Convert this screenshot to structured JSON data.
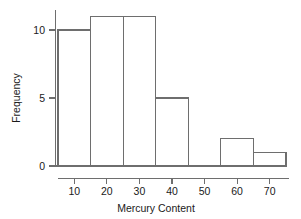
{
  "chart_data": {
    "type": "bar",
    "title": "",
    "subtitle": "",
    "xlabel": "Mercury Content",
    "ylabel": "Frequency",
    "grid": false,
    "legend": false,
    "legend_position": "none",
    "xlim": [
      0,
      78
    ],
    "ylim": [
      0,
      11.5
    ],
    "x_ticks": [
      10,
      20,
      30,
      40,
      50,
      60,
      70
    ],
    "x_tick_labels": [
      "10",
      "20",
      "30",
      "40",
      "50",
      "60",
      "70"
    ],
    "y_ticks": [
      0,
      5,
      10
    ],
    "y_tick_labels": [
      "0",
      "5",
      "10"
    ],
    "bin_width": 10,
    "bin_edges": [
      5,
      15,
      25,
      35,
      45,
      55,
      65,
      75
    ],
    "categories": [
      "5-15",
      "15-25",
      "25-35",
      "35-45",
      "45-55",
      "55-65",
      "65-75"
    ],
    "values": [
      10,
      11,
      11,
      5,
      0,
      2,
      1
    ],
    "bars": [
      {
        "label": "5-15",
        "x0": 5,
        "x1": 15,
        "value": 10
      },
      {
        "label": "15-25",
        "x0": 15,
        "x1": 25,
        "value": 11
      },
      {
        "label": "25-35",
        "x0": 25,
        "x1": 35,
        "value": 11
      },
      {
        "label": "35-45",
        "x0": 35,
        "x1": 45,
        "value": 5
      },
      {
        "label": "45-55",
        "x0": 45,
        "x1": 55,
        "value": 0
      },
      {
        "label": "55-65",
        "x0": 55,
        "x1": 65,
        "value": 2
      },
      {
        "label": "65-75",
        "x0": 65,
        "x1": 75,
        "value": 1
      }
    ],
    "colors": {
      "bar_fill": "#ffffff",
      "bar_stroke": "#6e6e6e",
      "axis": "#6e6e6e",
      "text": "#1a1a1a",
      "background": "#ffffff"
    }
  }
}
